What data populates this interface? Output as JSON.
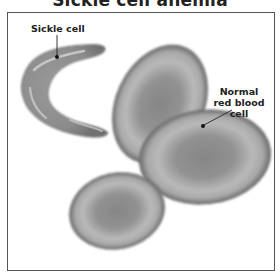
{
  "title": "Sickle cell anemia",
  "labels": {
    "sickle": "Sickle cell",
    "normal": "Normal red blood cell"
  },
  "colors": {
    "border": "#555555",
    "cell_edge": "#6e6e6e",
    "cell_mid": "#a9a9a9",
    "cell_center": "#7d7d7d",
    "sickle_body": "#8a8a8a",
    "sickle_highlight": "#c9c9c9",
    "text": "#222222"
  }
}
